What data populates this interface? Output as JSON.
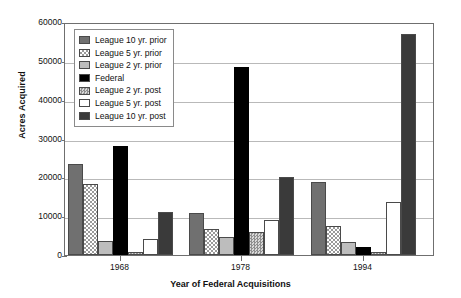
{
  "chart_data": {
    "type": "bar",
    "title": "",
    "xlabel": "Year of Federal Acquisitions",
    "ylabel": "Acres Acquired",
    "categories": [
      "1968",
      "1978",
      "1994"
    ],
    "ylim": [
      0,
      60000
    ],
    "yticks": [
      "0",
      "10000",
      "20000",
      "30000",
      "40000",
      "50000",
      "60000"
    ],
    "grid": true,
    "legend_position": "upper-left-inside",
    "series": [
      {
        "name": "League 10 yr. prior",
        "swatch": "dark-gray-solid",
        "color": "#707070",
        "values": [
          23400,
          10900,
          18700
        ]
      },
      {
        "name": "League 5 yr. prior",
        "swatch": "checkered-hatch",
        "color": "#9a9a9a",
        "values": [
          18400,
          6700,
          7400
        ]
      },
      {
        "name": "League 2 yr. prior",
        "swatch": "light-gray-solid",
        "color": "#bdbdbd",
        "values": [
          3600,
          4700,
          3400
        ]
      },
      {
        "name": "Federal",
        "swatch": "black-solid",
        "color": "#000000",
        "values": [
          28000,
          48400,
          2000
        ]
      },
      {
        "name": "League 2 yr. post",
        "swatch": "medium-gray-dotted",
        "color": "#8f8f8f",
        "values": [
          900,
          5800,
          700
        ]
      },
      {
        "name": "League 5 yr. post",
        "swatch": "white-solid",
        "color": "#ffffff",
        "values": [
          4100,
          9000,
          13700
        ]
      },
      {
        "name": "League 10 yr. post",
        "swatch": "very-dark-gray",
        "color": "#3a3a3a",
        "values": [
          11100,
          20000,
          57000
        ]
      }
    ]
  }
}
